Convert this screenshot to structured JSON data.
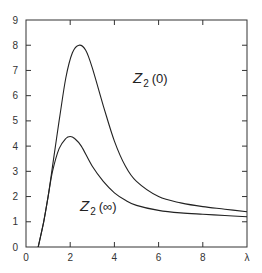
{
  "chart_data": {
    "type": "line",
    "title": "",
    "xlabel": "λ",
    "ylabel": "",
    "xlim": [
      0,
      10
    ],
    "ylim": [
      0,
      9
    ],
    "grid": false,
    "legend": "inline labels",
    "x_ticks": [
      "0",
      "2",
      "4",
      "6",
      "8",
      "λ"
    ],
    "y_ticks": [
      "0",
      "1",
      "2",
      "3",
      "4",
      "5",
      "6",
      "7",
      "8",
      "9"
    ],
    "series": [
      {
        "name": "Z2(0)",
        "label_main": "Z",
        "label_sub": "2",
        "label_arg": "(0)",
        "x": [
          0.55,
          0.8,
          1.0,
          1.2,
          1.5,
          1.8,
          2.1,
          2.4,
          2.7,
          3.0,
          3.5,
          4.0,
          4.5,
          5.0,
          6.0,
          7.0,
          8.0,
          9.0,
          10.0
        ],
        "y": [
          0.0,
          1.0,
          2.0,
          3.2,
          5.0,
          6.7,
          7.7,
          8.0,
          7.8,
          7.1,
          5.6,
          4.2,
          3.2,
          2.6,
          2.0,
          1.75,
          1.6,
          1.5,
          1.4
        ]
      },
      {
        "name": "Z2(∞)",
        "label_main": "Z",
        "label_sub": "2",
        "label_arg": "(∞)",
        "x": [
          0.55,
          0.8,
          1.0,
          1.2,
          1.5,
          1.8,
          2.0,
          2.2,
          2.5,
          3.0,
          3.5,
          4.0,
          4.5,
          5.0,
          6.0,
          7.0,
          8.0,
          9.0,
          10.0
        ],
        "y": [
          0.0,
          1.0,
          2.0,
          3.0,
          3.9,
          4.3,
          4.38,
          4.3,
          4.0,
          3.2,
          2.6,
          2.15,
          1.85,
          1.65,
          1.45,
          1.35,
          1.3,
          1.25,
          1.2
        ]
      }
    ]
  }
}
